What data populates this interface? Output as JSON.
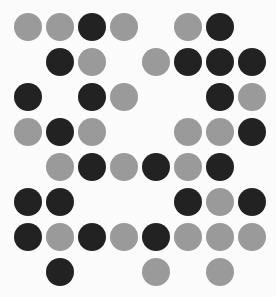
{
  "puzzle": {
    "type": "dot-grid",
    "rows": 8,
    "cols": 8,
    "legend": {
      "D": "dark",
      "G": "gray",
      "_": "empty"
    },
    "colors": {
      "dark": "#222222",
      "gray": "#9a9a9a",
      "background": "#fbfbfb"
    },
    "layout": {
      "origin_x": 14,
      "origin_y": 13,
      "pitch_x": 32,
      "pitch_y": 35,
      "diameter": 28
    },
    "grid": [
      "GGDG_GD_",
      "_DG_GDDD",
      "D_DG__DG",
      "GDG__GGD",
      "_GDGDGD_",
      "DD___DGD",
      "DGDGDGGG",
      "_D__G_G_"
    ]
  }
}
